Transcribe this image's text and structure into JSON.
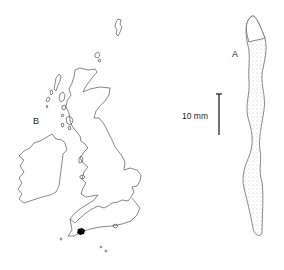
{
  "figure": {
    "panel_a_label": "A",
    "panel_b_label": "B",
    "scale_bar_label": "10 mm",
    "panel_a_subject": "worm-specimen",
    "panel_b_subject": "british-isles-distribution-map",
    "marker_color": "#000000",
    "line_color": "#444444"
  }
}
